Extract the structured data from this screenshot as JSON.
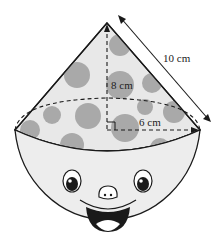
{
  "figure": {
    "type": "cone on hemisphere",
    "labels": {
      "slant": "10 cm",
      "height": "8 cm",
      "radius": "6 cm"
    },
    "colors": {
      "cone_fill": "#e6e6e6",
      "spot": "#a9a9a9",
      "bowl_fill": "#ededed",
      "outline": "#1a1a1a"
    }
  }
}
